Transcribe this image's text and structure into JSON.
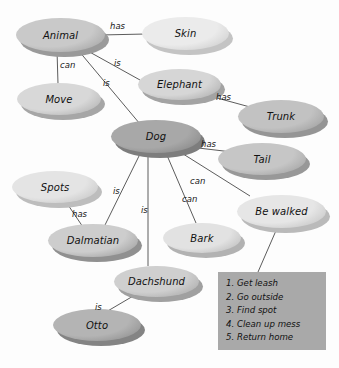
{
  "diagram": {
    "type": "semantic-network",
    "nodes": [
      {
        "id": "animal",
        "label": "Animal",
        "x": 16,
        "y": 18,
        "w": 89,
        "h": 34,
        "fill": "#c9c9c9",
        "shadow": "#9a9a9a"
      },
      {
        "id": "skin",
        "label": "Skin",
        "x": 142,
        "y": 17,
        "w": 87,
        "h": 33,
        "fill": "#ebebeb",
        "shadow": "#c4c4c4"
      },
      {
        "id": "move",
        "label": "Move",
        "x": 17,
        "y": 83,
        "w": 84,
        "h": 32,
        "fill": "#d8d8d8",
        "shadow": "#a6a6a6"
      },
      {
        "id": "elephant",
        "label": "Elephant",
        "x": 138,
        "y": 69,
        "w": 83,
        "h": 31,
        "fill": "#d6d6d6",
        "shadow": "#a3a3a3"
      },
      {
        "id": "trunk",
        "label": "Trunk",
        "x": 238,
        "y": 100,
        "w": 86,
        "h": 33,
        "fill": "#c2c2c2",
        "shadow": "#959595"
      },
      {
        "id": "dog",
        "label": "Dog",
        "x": 111,
        "y": 120,
        "w": 90,
        "h": 33,
        "fill": "#a8a8a8",
        "shadow": "#7d7d7d"
      },
      {
        "id": "tail",
        "label": "Tail",
        "x": 218,
        "y": 143,
        "w": 88,
        "h": 32,
        "fill": "#c6c6c6",
        "shadow": "#989898"
      },
      {
        "id": "spots",
        "label": "Spots",
        "x": 12,
        "y": 171,
        "w": 86,
        "h": 32,
        "fill": "#e4e4e4",
        "shadow": "#bdbdbd"
      },
      {
        "id": "dalmatian",
        "label": "Dalmatian",
        "x": 48,
        "y": 224,
        "w": 90,
        "h": 33,
        "fill": "#cdcdcd",
        "shadow": "#909090"
      },
      {
        "id": "bark",
        "label": "Bark",
        "x": 163,
        "y": 223,
        "w": 78,
        "h": 30,
        "fill": "#e2e2e2",
        "shadow": "#b2b2b2"
      },
      {
        "id": "bewalked",
        "label": "Be walked",
        "x": 237,
        "y": 195,
        "w": 89,
        "h": 33,
        "fill": "#e6e6e6",
        "shadow": "#bababa"
      },
      {
        "id": "dachshund",
        "label": "Dachshund",
        "x": 114,
        "y": 266,
        "w": 85,
        "h": 31,
        "fill": "#cfcfcf",
        "shadow": "#a0a0a0"
      },
      {
        "id": "otto",
        "label": "Otto",
        "x": 53,
        "y": 309,
        "w": 88,
        "h": 32,
        "fill": "#b4b4b4",
        "shadow": "#848484"
      }
    ],
    "edges": [
      {
        "from": "animal",
        "to": "skin",
        "label": "has",
        "x1": 100,
        "y1": 35,
        "x2": 146,
        "y2": 34,
        "lx": 110,
        "ly": 21
      },
      {
        "from": "animal",
        "to": "move",
        "label": "can",
        "x1": 57,
        "y1": 50,
        "x2": 58,
        "y2": 84,
        "lx": 60,
        "ly": 60
      },
      {
        "from": "elephant",
        "to": "animal",
        "label": "is",
        "x1": 140,
        "y1": 80,
        "x2": 86,
        "y2": 50,
        "lx": 114,
        "ly": 58
      },
      {
        "from": "dog",
        "to": "animal",
        "label": "is",
        "x1": 140,
        "y1": 124,
        "x2": 78,
        "y2": 50,
        "lx": 103,
        "ly": 78
      },
      {
        "from": "elephant",
        "to": "trunk",
        "label": "has",
        "x1": 206,
        "y1": 95,
        "x2": 250,
        "y2": 107,
        "lx": 216,
        "ly": 92
      },
      {
        "from": "dog",
        "to": "tail",
        "label": "has",
        "x1": 190,
        "y1": 147,
        "x2": 232,
        "y2": 152,
        "lx": 201,
        "ly": 139
      },
      {
        "from": "dog",
        "to": "bewalked",
        "label": "can",
        "x1": 180,
        "y1": 152,
        "x2": 250,
        "y2": 196,
        "lx": 190,
        "ly": 176
      },
      {
        "from": "dog",
        "to": "bark",
        "label": "can",
        "x1": 166,
        "y1": 153,
        "x2": 196,
        "y2": 223,
        "lx": 182,
        "ly": 194
      },
      {
        "from": "dalmatian",
        "to": "dog",
        "label": "is",
        "x1": 104,
        "y1": 227,
        "x2": 140,
        "y2": 154,
        "lx": 113,
        "ly": 186
      },
      {
        "from": "dachshund",
        "to": "dog",
        "label": "is",
        "x1": 148,
        "y1": 266,
        "x2": 148,
        "y2": 154,
        "lx": 141,
        "ly": 205
      },
      {
        "from": "spots",
        "to": "dalmatian",
        "label": "has",
        "x1": 64,
        "y1": 199,
        "x2": 85,
        "y2": 230,
        "lx": 72,
        "ly": 209
      },
      {
        "from": "otto",
        "to": "dachshund",
        "label": "is",
        "x1": 106,
        "y1": 312,
        "x2": 140,
        "y2": 292,
        "lx": 95,
        "ly": 302
      },
      {
        "from": "bewalked",
        "to": "procedure",
        "label": "",
        "x1": 278,
        "y1": 226,
        "x2": 258,
        "y2": 272,
        "lx": 0,
        "ly": 0
      }
    ],
    "procedure": {
      "name": "be-walked-steps",
      "steps": [
        "1. Get leash",
        "2. Go outside",
        "3. Find spot",
        "4. Clean up mess",
        "5. Return home"
      ]
    }
  }
}
